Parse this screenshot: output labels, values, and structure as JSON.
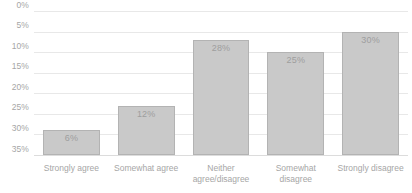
{
  "chart_data": {
    "type": "bar",
    "title": "",
    "subtitle": "",
    "xlabel": "",
    "ylabel": "",
    "categories": [
      "Strongly agree",
      "Somewhat agree",
      "Neither agree/disagree",
      "Somewhat disagree",
      "Strongly disagree"
    ],
    "values": [
      6,
      12,
      28,
      25,
      30
    ],
    "data_labels": [
      "6%",
      "12%",
      "28%",
      "25%",
      "30%"
    ],
    "ylim": [
      0,
      35
    ],
    "ytick_values": [
      0,
      5,
      10,
      15,
      20,
      25,
      30,
      35
    ],
    "ytick_labels": [
      "0%",
      "5%",
      "10%",
      "15%",
      "20%",
      "25%",
      "30%",
      "35%"
    ],
    "grid": true,
    "legend": false,
    "legend_position": "none",
    "bar_color": "#c9c9c9",
    "bar_border_color": "#b3b3b3",
    "gridline_color": "#e8e8e8",
    "axis_text_color": "#a6a6a6",
    "data_label_color": "#9e9e9e",
    "background_color": "#ffffff"
  }
}
